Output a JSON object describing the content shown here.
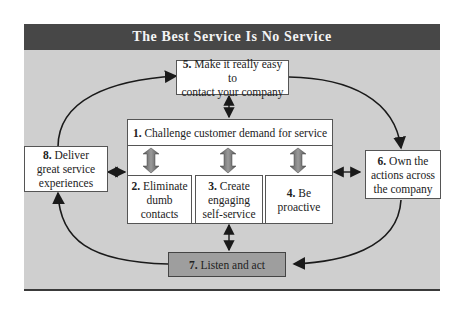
{
  "title": "The Best Service Is No Service",
  "colors": {
    "title_bar": "#474747",
    "panel": "#cfcfcf",
    "box_fill": "#ffffff",
    "highlight_box": "#9e9e9e",
    "arrow": "#1a1a1a"
  },
  "nodes": {
    "n1": {
      "num": "1.",
      "text": "Challenge customer demand for service"
    },
    "n2": {
      "num": "2.",
      "line1": "Eliminate",
      "line2": "dumb",
      "line3": "contacts"
    },
    "n3": {
      "num": "3.",
      "line1": "Create",
      "line2": "engaging",
      "line3": "self-service"
    },
    "n4": {
      "num": "4.",
      "line1": "Be",
      "line2": "proactive"
    },
    "n5": {
      "num": "5.",
      "line1": "Make it really easy to",
      "line2": "contact your company"
    },
    "n6": {
      "num": "6.",
      "line1": "Own the",
      "line2": "actions across",
      "line3": "the company"
    },
    "n7": {
      "num": "7.",
      "text": "Listen and act"
    },
    "n8": {
      "num": "8.",
      "line1": "Deliver",
      "line2": "great service",
      "line3": "experiences"
    }
  },
  "edges": [
    {
      "from": "8",
      "to": "5",
      "type": "curved-arrow"
    },
    {
      "from": "5",
      "to": "6",
      "type": "curved-arrow"
    },
    {
      "from": "6",
      "to": "7",
      "type": "curved-arrow"
    },
    {
      "from": "7",
      "to": "8",
      "type": "curved-arrow"
    },
    {
      "from": "5",
      "to": "1",
      "type": "double-arrow"
    },
    {
      "from": "8",
      "to": "1",
      "type": "double-arrow"
    },
    {
      "from": "1",
      "to": "6",
      "type": "double-arrow"
    },
    {
      "from": "1",
      "to": "7",
      "type": "double-arrow"
    },
    {
      "from": "1",
      "to": "2",
      "type": "double-block-arrow"
    },
    {
      "from": "1",
      "to": "3",
      "type": "double-block-arrow"
    },
    {
      "from": "1",
      "to": "4",
      "type": "double-block-arrow"
    }
  ]
}
